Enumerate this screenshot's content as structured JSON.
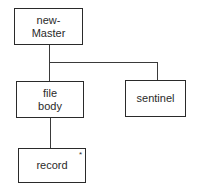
{
  "diagram": {
    "nodes": [
      {
        "id": "new-master",
        "label": "new-\nMaster"
      },
      {
        "id": "file-body",
        "label": "file\nbody"
      },
      {
        "id": "sentinel",
        "label": "sentinel"
      },
      {
        "id": "record",
        "label": "record",
        "marker": "*"
      }
    ],
    "edges": [
      {
        "from": "new-master",
        "to": "file-body"
      },
      {
        "from": "new-master",
        "to": "sentinel"
      },
      {
        "from": "file-body",
        "to": "record"
      }
    ]
  }
}
